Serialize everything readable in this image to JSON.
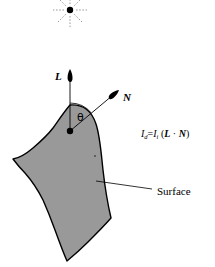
{
  "figure": {
    "background_color": "#ffffff",
    "stroke_color": "#000000",
    "surface_fill_color": "#999999"
  },
  "light_source": {
    "icon": "light-source-icon",
    "center_x": 70,
    "center_y": 10,
    "dot_radius": 3.2,
    "ray_count": 8,
    "ray_inner_radius": 6,
    "ray_outer_radius": 17
  },
  "vectors": [
    {
      "id": "light-vector",
      "label": "L",
      "label_x": 55,
      "label_y": 71,
      "from_x": 70,
      "from_y": 131,
      "to_x": 70,
      "to_y": 69
    },
    {
      "id": "normal-vector",
      "label": "N",
      "label_x": 123,
      "label_y": 92,
      "from_x": 70,
      "from_y": 131,
      "to_x": 119,
      "to_y": 90
    }
  ],
  "angle": {
    "label": "θ",
    "label_x": 77,
    "label_y": 112,
    "arc_radius": 28,
    "origin_x": 70,
    "origin_y": 131
  },
  "origin_point": {
    "name": "surface-point",
    "x": 70,
    "y": 131,
    "radius": 3.2
  },
  "equation": {
    "text": "Id = Ii (L · N)",
    "result_symbol": "I",
    "result_sub": "d",
    "equals": "=",
    "incident_symbol": "I",
    "incident_sub": "i",
    "open_paren": "(",
    "light_vec": "L",
    "dot": "·",
    "normal_vec": "N",
    "close_paren": ")",
    "x": 141,
    "y": 129
  },
  "callout": {
    "label": "Surface",
    "label_x": 157,
    "label_y": 186,
    "leader_from_x": 152,
    "leader_from_y": 189,
    "leader_to_x": 96,
    "leader_to_y": 181
  },
  "surface": {
    "name": "shaded-surface",
    "path": "M 70 105 C 84 104 92 112 96 124 C 100 136 101 152 103 170 C 105 188 108 205 111 218 C 104 226 96 234 88 242 C 80 250 73 256 67 261 C 63 252 59 241 55 230 C 51 219 47 209 43 200 C 38 190 32 181 25 173 C 20 168 16 163 13 159 C 19 158 26 154 33 148 C 40 142 47 136 53 128 C 58 121 64 112 70 105 Z",
    "speck_x": 95,
    "speck_y": 156
  }
}
